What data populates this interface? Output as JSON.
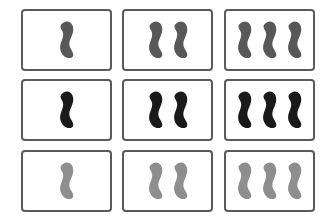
{
  "game": {
    "title": "Set card grid",
    "layout": {
      "rows": 3,
      "columns": 3
    },
    "colors": {
      "dark_gray": "#585858",
      "black": "#1a1a1a",
      "light_gray": "#8e8e8e",
      "card_border": "#5a5a5a",
      "card_background": "#ffffff"
    },
    "cards": [
      {
        "row": 0,
        "col": 0,
        "count": 1,
        "shape": "squiggle",
        "shading": "solid",
        "color": "#585858"
      },
      {
        "row": 0,
        "col": 1,
        "count": 2,
        "shape": "squiggle",
        "shading": "solid",
        "color": "#585858"
      },
      {
        "row": 0,
        "col": 2,
        "count": 3,
        "shape": "squiggle",
        "shading": "solid",
        "color": "#585858"
      },
      {
        "row": 1,
        "col": 0,
        "count": 1,
        "shape": "squiggle",
        "shading": "solid",
        "color": "#1a1a1a"
      },
      {
        "row": 1,
        "col": 1,
        "count": 2,
        "shape": "squiggle",
        "shading": "solid",
        "color": "#1a1a1a"
      },
      {
        "row": 1,
        "col": 2,
        "count": 3,
        "shape": "squiggle",
        "shading": "solid",
        "color": "#1a1a1a"
      },
      {
        "row": 2,
        "col": 0,
        "count": 1,
        "shape": "squiggle",
        "shading": "solid",
        "color": "#8e8e8e"
      },
      {
        "row": 2,
        "col": 1,
        "count": 2,
        "shape": "squiggle",
        "shading": "solid",
        "color": "#8e8e8e"
      },
      {
        "row": 2,
        "col": 2,
        "count": 3,
        "shape": "squiggle",
        "shading": "solid",
        "color": "#8e8e8e"
      }
    ]
  }
}
